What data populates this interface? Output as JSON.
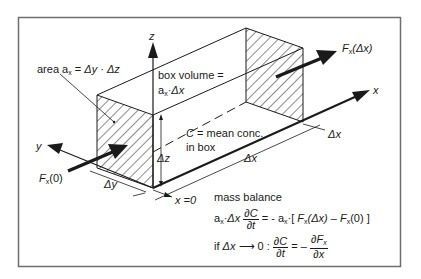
{
  "figure": {
    "frame_color": "#6e6e6e",
    "line_color": "#1a1a1a",
    "axes": {
      "x_label": "x",
      "y_label": "y",
      "z_label": "z"
    },
    "labels": {
      "area": {
        "prefix": "area ",
        "a": "a",
        "a_sub": "x",
        "eq": " = ",
        "dy": "Δy",
        "dot": " · ",
        "dz": "Δz"
      },
      "box_volume": {
        "line1": "box volume =",
        "a": "a",
        "a_sub": "x",
        "dot": "·",
        "dx": "Δx"
      },
      "mean_conc": {
        "c": "C",
        "line1_rest": " = mean conc.",
        "line2": "in box"
      },
      "flux_out": {
        "f": "F",
        "f_sub": "x",
        "arg": "(Δx)"
      },
      "flux_in": {
        "f": "F",
        "f_sub": "x",
        "arg": "(0)"
      },
      "delta_x_top": "Δx",
      "delta_x_bottom": "Δx",
      "delta_y": "Δy",
      "delta_z": "Δz",
      "x_zero": "x =0"
    },
    "equations": {
      "title": "mass balance",
      "eq1": {
        "lhs_a": "a",
        "lhs_a_sub": "x",
        "lhs_dot": "·",
        "lhs_dx": "Δx ",
        "frac_num": "∂C",
        "frac_den": "∂t",
        "rhs": " = - a",
        "rhs_a_sub": "x",
        "rhs_bracket_open": "·[ ",
        "f1": "F",
        "f1_sub": "x",
        "f1_arg": "(Δx) – ",
        "f2": "F",
        "f2_sub": "x",
        "f2_arg": "(0) ]"
      },
      "eq2": {
        "prefix": "if ",
        "dx": "Δx",
        "arrow": " ⟶ 0 : ",
        "frac1_num": "∂C",
        "frac1_den": "∂t",
        "eq": " = – ",
        "frac2_num": "∂F",
        "frac2_num_sub": "x",
        "frac2_den": "∂x"
      }
    }
  }
}
